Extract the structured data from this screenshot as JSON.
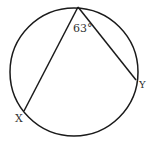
{
  "diagram": {
    "type": "inscribed-angle",
    "angle_label": "63°",
    "angle_degrees": 63,
    "points": {
      "vertex": "",
      "left": "X",
      "right": "Y"
    },
    "stroke_color": "#1a1a1a",
    "label_color": "#333333"
  }
}
